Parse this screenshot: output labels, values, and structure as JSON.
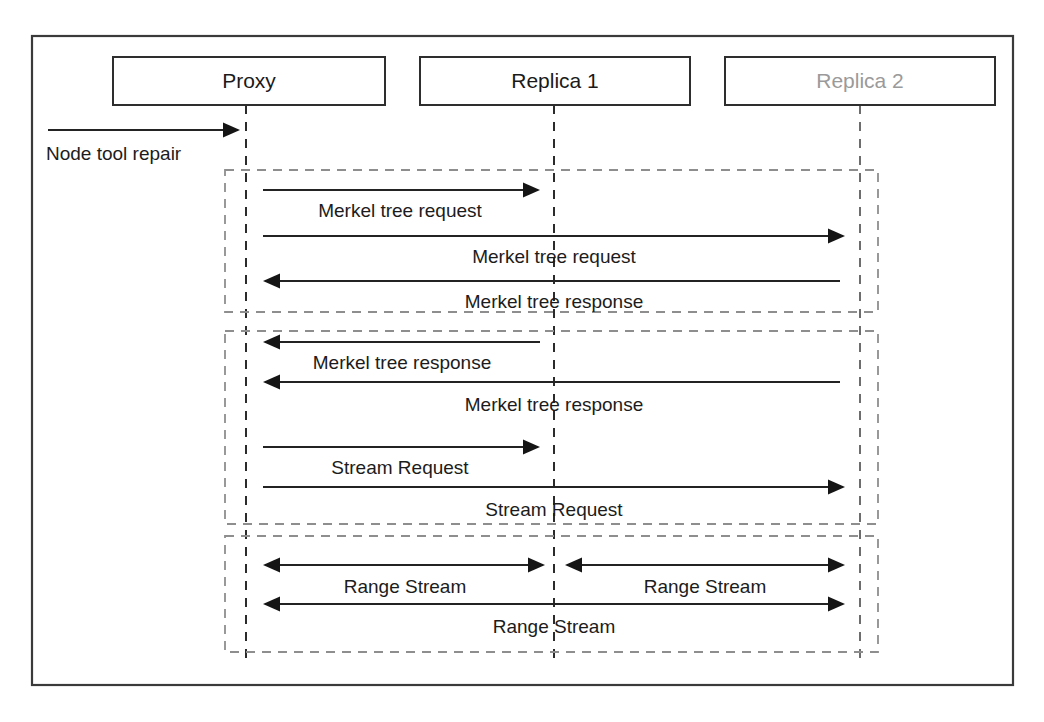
{
  "diagram": {
    "type": "sequence-diagram",
    "canvas": {
      "width": 1044,
      "height": 722
    },
    "frame": {
      "x": 32,
      "y": 36,
      "width": 981,
      "height": 649
    },
    "colors": {
      "background": "#ffffff",
      "frame_stroke": "#3a3a3a",
      "box_stroke": "#2e2e2e",
      "label_text": "#1a1a1a",
      "muted_text": "#9a9a9a",
      "lifeline": "#2b2b2b",
      "group_stroke": "#8e8e8e",
      "arrow": "#232323"
    }
  },
  "participants": [
    {
      "id": "proxy",
      "label": "Proxy",
      "muted": false,
      "box": {
        "x": 113,
        "y": 57,
        "width": 272,
        "height": 48
      },
      "lifeline_x": 246,
      "lifeline_top": 105,
      "lifeline_bottom": 666
    },
    {
      "id": "replica1",
      "label": "Replica 1",
      "muted": false,
      "box": {
        "x": 420,
        "y": 57,
        "width": 270,
        "height": 48
      },
      "lifeline_x": 554,
      "lifeline_top": 105,
      "lifeline_bottom": 666
    },
    {
      "id": "replica2",
      "label": "Replica 2",
      "muted": true,
      "box": {
        "x": 725,
        "y": 57,
        "width": 270,
        "height": 48
      },
      "lifeline_x": 860,
      "lifeline_top": 105,
      "lifeline_bottom": 666
    }
  ],
  "entry_message": {
    "label": "Node tool repair",
    "from_x": 48,
    "to_x": 240,
    "y": 130,
    "label_x": 46,
    "label_y": 155,
    "direction": "right",
    "label_align": "left"
  },
  "groups": [
    {
      "id": "group-merkel-request",
      "box": {
        "x": 225,
        "y": 170,
        "width": 653,
        "height": 142
      },
      "messages": [
        {
          "id": "msg-merkel-tree-request-1",
          "label": "Merkel tree request",
          "from_x": 263,
          "to_x": 540,
          "y": 190,
          "label_x": 400,
          "label_y": 212,
          "direction": "right"
        },
        {
          "id": "msg-merkel-tree-request-2",
          "label": "Merkel tree request",
          "from_x": 263,
          "to_x": 845,
          "y": 236,
          "label_x": 554,
          "label_y": 258,
          "direction": "right"
        },
        {
          "id": "msg-merkel-tree-response-1",
          "label": "Merkel tree response",
          "from_x": 840,
          "to_x": 263,
          "y": 281,
          "label_x": 554,
          "label_y": 303,
          "direction": "left"
        }
      ]
    },
    {
      "id": "group-merkel-response-stream-request",
      "box": {
        "x": 225,
        "y": 331,
        "width": 653,
        "height": 193
      },
      "messages": [
        {
          "id": "msg-merkel-tree-response-2",
          "label": "Merkel tree response",
          "from_x": 540,
          "to_x": 263,
          "y": 342,
          "label_x": 402,
          "label_y": 364,
          "direction": "left"
        },
        {
          "id": "msg-merkel-tree-response-3",
          "label": "Merkel tree response",
          "from_x": 840,
          "to_x": 263,
          "y": 382,
          "label_x": 554,
          "label_y": 406,
          "direction": "left"
        },
        {
          "id": "msg-stream-request-1",
          "label": "Stream Request",
          "from_x": 263,
          "to_x": 540,
          "y": 447,
          "label_x": 400,
          "label_y": 469,
          "direction": "right"
        },
        {
          "id": "msg-stream-request-2",
          "label": "Stream Request",
          "from_x": 263,
          "to_x": 845,
          "y": 487,
          "label_x": 554,
          "label_y": 511,
          "direction": "right"
        }
      ]
    },
    {
      "id": "group-range-stream",
      "box": {
        "x": 225,
        "y": 536,
        "width": 653,
        "height": 116
      },
      "messages": [
        {
          "id": "msg-range-stream-left",
          "label": "Range Stream",
          "from_x": 263,
          "to_x": 545,
          "y": 565,
          "label_x": 405,
          "label_y": 588,
          "direction": "both"
        },
        {
          "id": "msg-range-stream-right",
          "label": "Range Stream",
          "from_x": 565,
          "to_x": 845,
          "y": 565,
          "label_x": 705,
          "label_y": 588,
          "direction": "both"
        },
        {
          "id": "msg-range-stream-full",
          "label": "Range Stream",
          "from_x": 263,
          "to_x": 845,
          "y": 604,
          "label_x": 554,
          "label_y": 628,
          "direction": "both"
        }
      ]
    }
  ]
}
